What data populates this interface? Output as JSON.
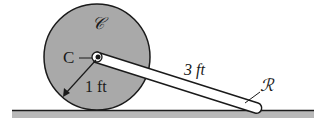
{
  "diagram": {
    "labels": {
      "disk_name": "𝒞",
      "center_label": "C",
      "radius_label": "1 ft",
      "rod_length_label": "3 ft",
      "rod_name": "ℛ"
    },
    "colors": {
      "disk_fill": "#a9a9a9",
      "ground_fill": "#b8b8b8",
      "outline": "#1a1a1a",
      "rod_fill": "#ffffff"
    }
  }
}
